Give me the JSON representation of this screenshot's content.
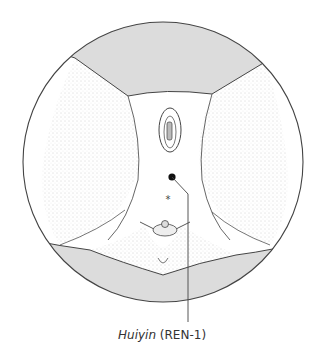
{
  "figure": {
    "point": {
      "name_italic": "Huiyin",
      "code": "(REN-1)"
    },
    "colors": {
      "shade": "#dcdcdc",
      "line": "#444444",
      "dot": "#111111",
      "background": "#ffffff"
    }
  }
}
